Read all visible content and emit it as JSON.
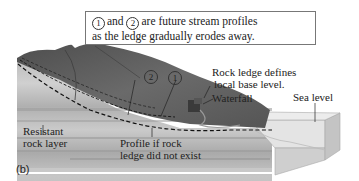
{
  "callout": {
    "marker_1": "1",
    "connector": "and",
    "marker_2": "2",
    "line1_rest": "are future stream profiles",
    "line2": "as the ledge gradually erodes away."
  },
  "labels": {
    "rock_ledge_line1": "Rock ledge defines",
    "rock_ledge_line2": "local base level.",
    "waterfall": "Waterfall",
    "sea_level": "Sea level",
    "resistant_line1": "Resistant",
    "resistant_line2": "rock layer",
    "profile_line1": "Profile if rock",
    "profile_line2": "ledge did not exist",
    "marker_1": "1",
    "marker_2": "2"
  },
  "figure_label": "(b)",
  "colors": {
    "terrain_dark": "#5a5a5a",
    "terrain_mid": "#7a7a7a",
    "strata_light": "#c8c8c8",
    "strata_band": "#a8a8a8",
    "sea_top": "#e4e4e4",
    "sea_front": "#cfcfcf",
    "dashed": "#111111"
  }
}
